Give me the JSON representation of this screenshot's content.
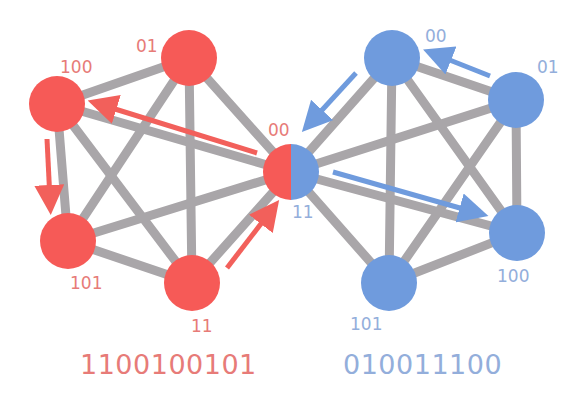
{
  "colors": {
    "red_node": "#F65A57",
    "blue_node": "#6F9BDD",
    "red_text": "#E77B78",
    "blue_text": "#93AEDB",
    "edge": "#A9A6A9",
    "red_arrow": "#F2605B",
    "blue_arrow": "#6F9BDD"
  },
  "graphs": {
    "red": {
      "sequence_label": "1100100101",
      "nodes": [
        {
          "id": "r100",
          "label": "100",
          "x": 57,
          "y": 104
        },
        {
          "id": "r01",
          "label": "01",
          "x": 189,
          "y": 58
        },
        {
          "id": "r101",
          "label": "101",
          "x": 68,
          "y": 241
        },
        {
          "id": "r11",
          "label": "11",
          "x": 192,
          "y": 283
        }
      ]
    },
    "blue": {
      "sequence_label": "010011100",
      "nodes": [
        {
          "id": "b00",
          "label": "00",
          "x": 392,
          "y": 58
        },
        {
          "id": "b01",
          "label": "01",
          "x": 516,
          "y": 100
        },
        {
          "id": "b100",
          "label": "100",
          "x": 517,
          "y": 233
        },
        {
          "id": "b101",
          "label": "101",
          "x": 389,
          "y": 283
        }
      ]
    },
    "shared_node": {
      "id": "center",
      "label_red": "00",
      "label_blue": "11",
      "x": 291,
      "y": 172
    }
  },
  "labels": {
    "r100": "100",
    "r01": "01",
    "r101": "101",
    "r11": "11",
    "center_red": "00",
    "center_blue": "11",
    "b00": "00",
    "b01": "01",
    "b100": "100",
    "b101": "101",
    "red_sequence": "1100100101",
    "blue_sequence": "010011100"
  }
}
